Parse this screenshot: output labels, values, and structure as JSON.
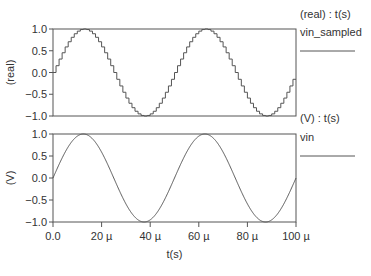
{
  "chart_data": [
    {
      "type": "line",
      "title": "",
      "legend_header": "(real) : t(s)",
      "series": [
        {
          "name": "vin_sampled",
          "style": "stepped",
          "amplitude": 1.0,
          "frequency_hz": 20000,
          "phase": 0
        }
      ],
      "xlabel": "",
      "ylabel": "(real)",
      "xlim": [
        0,
        0.0001
      ],
      "ylim": [
        -1.0,
        1.0
      ],
      "yticks": [
        "1.0",
        "0.5",
        "0.0",
        "−0.5",
        "−1.0"
      ],
      "grid": false,
      "legend_position": "right"
    },
    {
      "type": "line",
      "title": "",
      "legend_header": "(V) : t(s)",
      "series": [
        {
          "name": "vin",
          "style": "smooth",
          "amplitude": 1.0,
          "frequency_hz": 20000,
          "phase": 0
        }
      ],
      "xlabel": "t(s)",
      "ylabel": "(V)",
      "xlim": [
        0,
        0.0001
      ],
      "ylim": [
        -1.0,
        1.0
      ],
      "xticks": [
        "0.0",
        "20 µ",
        "40 µ",
        "60 µ",
        "80 µ",
        "100 µ"
      ],
      "yticks": [
        "1.0",
        "0.5",
        "0.0",
        "−0.5",
        "−1.0"
      ],
      "grid": false,
      "legend_position": "right"
    }
  ],
  "colors": {
    "axis": "#555555",
    "trace": "#555555",
    "text": "#333333"
  }
}
